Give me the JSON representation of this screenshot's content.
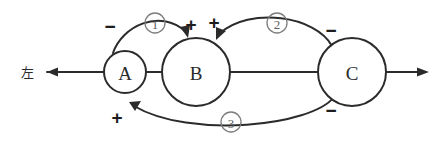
{
  "diagram": {
    "background_color": "#ffffff",
    "stroke_color": "#2b2b2b",
    "marker_color": "#7d7d7d",
    "nodes": [
      {
        "id": "A",
        "label": "A",
        "cx": 125,
        "cy": 72,
        "r": 21
      },
      {
        "id": "B",
        "label": "B",
        "cx": 196,
        "cy": 72,
        "r": 34
      },
      {
        "id": "C",
        "label": "C",
        "cx": 352,
        "cy": 72,
        "r": 34
      }
    ],
    "exit_label_left": "左",
    "loops": [
      {
        "id": "loop1",
        "label": "①",
        "source": "A",
        "target": "B",
        "source_sign": "−",
        "target_sign": "+"
      },
      {
        "id": "loop2",
        "label": "②",
        "source": "C",
        "target": "B",
        "source_sign": "−",
        "target_sign": "+"
      },
      {
        "id": "loop3",
        "label": "③",
        "source": "C",
        "target": "A",
        "source_sign": "−",
        "target_sign": "+"
      }
    ],
    "signs": {
      "loop1_source": "−",
      "loop1_target": "+",
      "loop2_target": "+",
      "loop2_source": "−",
      "loop3_target": "+",
      "loop3_source": "−"
    },
    "markers": {
      "one": "①",
      "two": "②",
      "three": "③",
      "one_text": "1",
      "two_text": "2",
      "three_text": "3"
    }
  }
}
